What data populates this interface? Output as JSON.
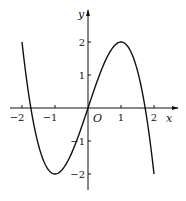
{
  "chart_data": {
    "type": "line",
    "title": "",
    "function": "y = -x^3 + 3x",
    "xlabel": "x",
    "ylabel": "y",
    "origin_label": "O",
    "xlim": [
      -2,
      2
    ],
    "ylim": [
      -2,
      2
    ],
    "grid": false,
    "x_ticks": [
      {
        "value": -2,
        "label": "-2"
      },
      {
        "value": -1,
        "label": "-1"
      },
      {
        "value": 1,
        "label": "1"
      },
      {
        "value": 2,
        "label": "2"
      }
    ],
    "y_ticks": [
      {
        "value": 2,
        "label": "2"
      },
      {
        "value": 1,
        "label": "1"
      },
      {
        "value": -1,
        "label": "-1"
      },
      {
        "value": -2,
        "label": "-2"
      }
    ],
    "series": [
      {
        "name": "f(x)",
        "x": [
          -2,
          -1.75,
          -1.5,
          -1.25,
          -1,
          -0.75,
          -0.5,
          -0.25,
          0,
          0.25,
          0.5,
          0.75,
          1,
          1.25,
          1.5,
          1.75,
          2
        ],
        "values": [
          2,
          0.11,
          -1.13,
          -1.8,
          -2,
          -1.83,
          -1.38,
          -0.73,
          0,
          0.73,
          1.38,
          1.83,
          2,
          1.8,
          1.13,
          -0.11,
          -2
        ]
      }
    ],
    "key_points": [
      {
        "x": -1,
        "y": -2,
        "note": "local minimum"
      },
      {
        "x": 1,
        "y": 2,
        "note": "local maximum"
      },
      {
        "x": 0,
        "y": 0,
        "note": "origin"
      }
    ]
  }
}
